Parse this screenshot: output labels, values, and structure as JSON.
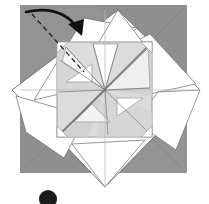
{
  "figure": {
    "kind": "origami-folding-diagram",
    "width": 209,
    "height": 204,
    "background_color": "#ffffff"
  },
  "colors": {
    "paper_back_gray": "#9a9a9a",
    "paper_back_gray_dark": "#8e8e8e",
    "paper_front_white": "#ffffff",
    "panel_light_gray": "#dcdcdc",
    "panel_light_gray_2": "#d2d2d2",
    "panel_pale": "#e6e6e6",
    "crease_line": "#8c8c8c",
    "crease_line_faint": "#bdbdbd",
    "edge_line": "#555555",
    "fold_dashed": "#1a1a1a",
    "arrow_stroke": "#111111",
    "badge_fill": "#1c1c1c",
    "badge_text": "#ffffff"
  },
  "base_sheet": {
    "label": "base square colored side",
    "x": 20,
    "y": 5,
    "width": 167,
    "height": 168,
    "fill": "#9a9a9a"
  },
  "diamond": {
    "label": "white square rotated 45 degrees",
    "points": "118,10 200,90 105,187 12,90",
    "fill": "#ffffff"
  },
  "inner_square": {
    "label": "central pinwheel square",
    "x": 57,
    "y": 42,
    "width": 95,
    "height": 95,
    "fill": "#dcdcdc"
  },
  "center_point": {
    "label": "pinwheel convergence point",
    "x": 105,
    "y": 90
  },
  "fold_line": {
    "label": "valley fold dashed line top-left corner",
    "x1": 32,
    "y1": 14,
    "x2": 84,
    "y2": 72,
    "style": "dashed"
  },
  "arrow": {
    "label": "fold-over arrow",
    "path": "M 26 12 Q 62 4 79 30",
    "head_points": "79,32 69,23 84,20",
    "direction": "clockwise-fold-down-right"
  },
  "step_badge": {
    "label": "step number badge",
    "cx": 48,
    "cy": 199,
    "r": 9,
    "text": ""
  },
  "creases": [
    {
      "name": "horizontal-midline",
      "d": "M 20 90 L 200 90"
    },
    {
      "name": "vertical-midline",
      "d": "M 105 10 L 105 187"
    },
    {
      "name": "inner-square-top",
      "d": "M 57 42 L 152 42"
    },
    {
      "name": "inner-square-bottom",
      "d": "M 57 137 L 152 137"
    },
    {
      "name": "inner-square-left",
      "d": "M 57 42 L 57 137"
    },
    {
      "name": "inner-square-right",
      "d": "M 152 42 L 152 137"
    }
  ],
  "pinwheel_spokes": [
    {
      "name": "spoke-up-left",
      "d": "M 105 90 L 66 47"
    },
    {
      "name": "spoke-up",
      "d": "M 105 90 L 93 44"
    },
    {
      "name": "spoke-up-right",
      "d": "M 105 90 L 118 44"
    },
    {
      "name": "spoke-right-up",
      "d": "M 105 90 L 148 48"
    },
    {
      "name": "spoke-right",
      "d": "M 105 90 L 150 88"
    },
    {
      "name": "spoke-down-right",
      "d": "M 105 90 L 147 131"
    },
    {
      "name": "spoke-down",
      "d": "M 105 90 L 108 135"
    },
    {
      "name": "spoke-down-left",
      "d": "M 105 90 L 62 132"
    },
    {
      "name": "spoke-left",
      "d": "M 105 90 L 59 92"
    },
    {
      "name": "spoke-left-up",
      "d": "M 105 90 L 60 60"
    }
  ],
  "caption": {
    "visible": false,
    "text": ""
  }
}
